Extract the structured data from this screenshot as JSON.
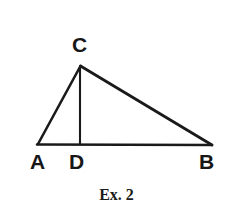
{
  "figure": {
    "kind": "geometry-diagram",
    "shape": "triangle-with-cevian",
    "caption": "Ex. 2",
    "background_color": "#ffffff",
    "stroke_color": "#1a1a1a",
    "label_color": "#171717",
    "stroke_width": 2.4,
    "cevian_stroke_width": 2.0,
    "vertices": [
      {
        "id": "C",
        "label": "C",
        "x": 80,
        "y": 66,
        "label_x": 72,
        "label_y": 34
      },
      {
        "id": "A",
        "label": "A",
        "x": 38,
        "y": 144,
        "label_x": 30,
        "label_y": 151
      },
      {
        "id": "D",
        "label": "D",
        "x": 80,
        "y": 144,
        "label_x": 69,
        "label_y": 151
      },
      {
        "id": "B",
        "label": "B",
        "x": 212,
        "y": 145,
        "label_x": 199,
        "label_y": 151
      }
    ],
    "segments": [
      {
        "id": "AC",
        "from": "A",
        "to": "C",
        "role": "side"
      },
      {
        "id": "CB",
        "from": "C",
        "to": "B",
        "role": "side"
      },
      {
        "id": "AB",
        "from": "A",
        "to": "B",
        "role": "base"
      },
      {
        "id": "CD",
        "from": "C",
        "to": "D",
        "role": "cevian-altitude"
      }
    ]
  }
}
